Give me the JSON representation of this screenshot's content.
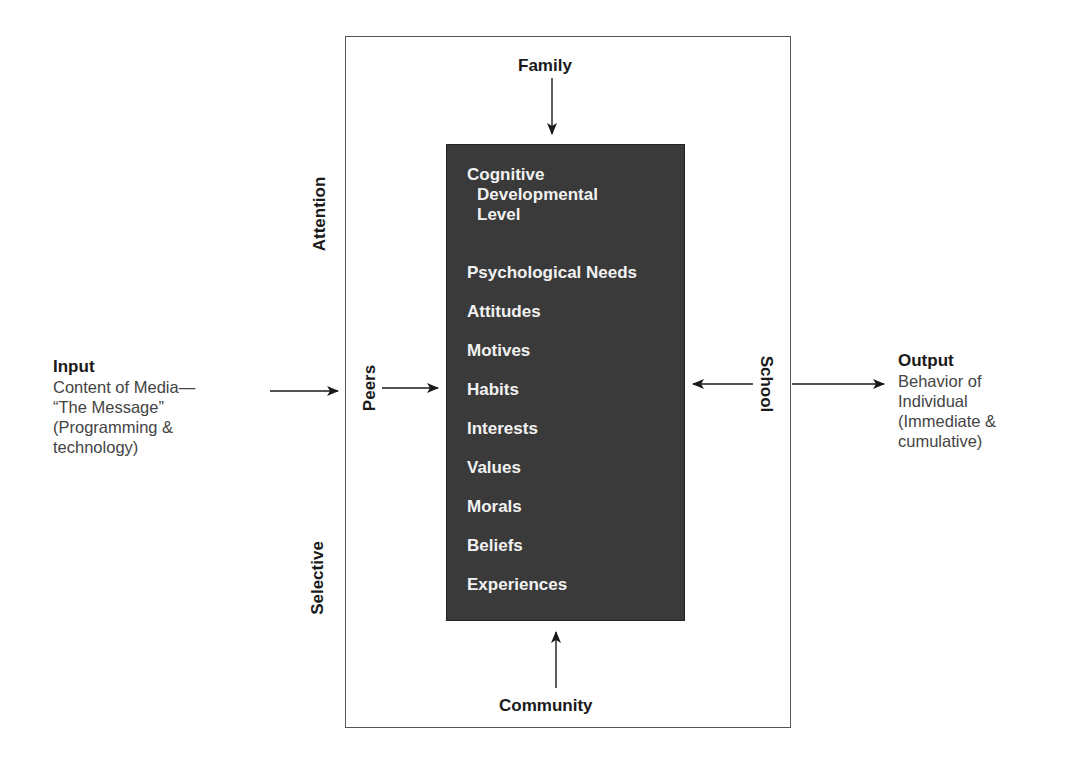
{
  "diagram": {
    "input": {
      "heading": "Input",
      "lines": [
        "Content of Media—",
        "“The Message”",
        "(Programming &",
        "technology)"
      ]
    },
    "output": {
      "heading": "Output",
      "lines": [
        "Behavior of",
        "Individual",
        "(Immediate &",
        "cumulative)"
      ]
    },
    "outer_labels": {
      "top": "Family",
      "bottom": "Community",
      "left_inner": "Peers",
      "right_inner": "School",
      "left_upper": "Attention",
      "left_lower": "Selective"
    },
    "individual_factors": {
      "first": [
        "Cognitive",
        "Developmental",
        "Level"
      ],
      "items": [
        "Psychological Needs",
        "Attitudes",
        "Motives",
        "Habits",
        "Interests",
        "Values",
        "Morals",
        "Beliefs",
        "Experiences"
      ]
    },
    "colors": {
      "inner_box_fill": "#3a3a3a",
      "inner_text": "#f2f2f2",
      "outer_border": "#555555",
      "label_text": "#1a1a1a",
      "description_text": "#444444"
    }
  }
}
